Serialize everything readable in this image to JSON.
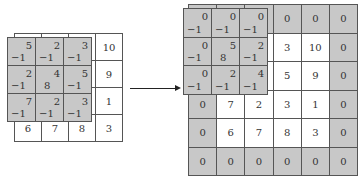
{
  "left": {
    "input": [
      [
        "",
        "",
        "",
        "10"
      ],
      [
        "",
        "",
        "",
        "9"
      ],
      [
        "",
        "",
        "",
        "1"
      ],
      [
        "6",
        "7",
        "8",
        "3"
      ]
    ],
    "kernel_values": [
      [
        "5",
        "2",
        "3"
      ],
      [
        "2",
        "4",
        "5"
      ],
      [
        "7",
        "2",
        "3"
      ]
    ],
    "kernel_weights": [
      [
        "−1",
        "−1",
        "−1"
      ],
      [
        "−1",
        "8",
        "−1"
      ],
      [
        "−1",
        "−1",
        "−1"
      ]
    ]
  },
  "right": {
    "padded": [
      [
        "0",
        "0",
        "0",
        "0",
        "0",
        "0"
      ],
      [
        "0",
        "",
        "",
        "3",
        "10",
        "0"
      ],
      [
        "0",
        "",
        "",
        "5",
        "9",
        "0"
      ],
      [
        "0",
        "7",
        "2",
        "3",
        "1",
        "0"
      ],
      [
        "0",
        "6",
        "7",
        "8",
        "3",
        "0"
      ],
      [
        "0",
        "0",
        "0",
        "0",
        "0",
        "0"
      ]
    ],
    "kernel_values": [
      [
        "0",
        "0",
        "0"
      ],
      [
        "0",
        "5",
        "2"
      ],
      [
        "0",
        "2",
        "4"
      ]
    ],
    "kernel_weights": [
      [
        "−1",
        "−1",
        "−1"
      ],
      [
        "−1",
        "8",
        "−1"
      ],
      [
        "−1",
        "−1",
        "−1"
      ]
    ]
  },
  "colors": {
    "pad": "#c8c8c8",
    "line": "#555555"
  }
}
